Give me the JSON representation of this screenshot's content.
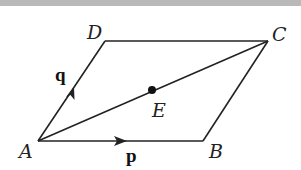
{
  "diagram": {
    "title": "",
    "points": {
      "A": {
        "label": "A",
        "x": 38,
        "y": 141
      },
      "B": {
        "label": "B",
        "x": 203,
        "y": 141
      },
      "C": {
        "label": "C",
        "x": 268,
        "y": 41
      },
      "D": {
        "label": "D",
        "x": 105,
        "y": 41
      },
      "E": {
        "label": "E",
        "x": 152,
        "y": 90
      }
    },
    "vectors": {
      "p": {
        "label": "p",
        "from": "A",
        "to": "B"
      },
      "q": {
        "label": "q",
        "from": "A",
        "to": "D"
      }
    },
    "segments": [
      "AB",
      "BC",
      "CD",
      "DA",
      "AC"
    ],
    "colors": {
      "line": "#222222",
      "background": "#ffffff",
      "band": "#b9b9b9"
    }
  }
}
